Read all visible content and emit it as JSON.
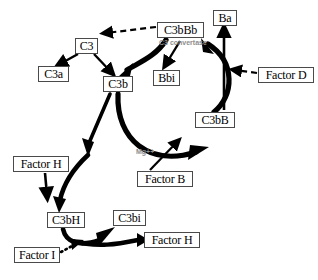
{
  "diagram": {
    "nodes": [
      {
        "id": "c3",
        "label": "C3",
        "x": 75,
        "y": 38,
        "w": 23,
        "h": 16
      },
      {
        "id": "c3a",
        "label": "C3a",
        "x": 38,
        "y": 66,
        "w": 31,
        "h": 16
      },
      {
        "id": "c3b",
        "label": "C3b",
        "x": 103,
        "y": 76,
        "w": 30,
        "h": 16
      },
      {
        "id": "bbi",
        "label": "Bbi",
        "x": 153,
        "y": 70,
        "w": 27,
        "h": 16
      },
      {
        "id": "c3bbb",
        "label": "C3bBb",
        "x": 157,
        "y": 22,
        "w": 47,
        "h": 16
      },
      {
        "id": "ba",
        "label": "Ba",
        "x": 213,
        "y": 10,
        "w": 24,
        "h": 16
      },
      {
        "id": "factord",
        "label": "Factor D",
        "x": 258,
        "y": 67,
        "w": 56,
        "h": 16
      },
      {
        "id": "c3bb",
        "label": "C3bB",
        "x": 195,
        "y": 112,
        "w": 40,
        "h": 16
      },
      {
        "id": "factorb",
        "label": "Factor B",
        "x": 137,
        "y": 171,
        "w": 56,
        "h": 16
      },
      {
        "id": "factorh1",
        "label": "Factor H",
        "x": 13,
        "y": 156,
        "w": 56,
        "h": 16
      },
      {
        "id": "c3bh",
        "label": "C3bH",
        "x": 47,
        "y": 212,
        "w": 38,
        "h": 16
      },
      {
        "id": "c3bi",
        "label": "C3bi",
        "x": 113,
        "y": 210,
        "w": 33,
        "h": 16
      },
      {
        "id": "factorh2",
        "label": "Factor H",
        "x": 144,
        "y": 232,
        "w": 56,
        "h": 16
      },
      {
        "id": "factori",
        "label": "Factor I",
        "x": 14,
        "y": 247,
        "w": 46,
        "h": 16
      }
    ],
    "annotations": [
      {
        "id": "c3-convertase",
        "label": "C3 convertase",
        "x": 159,
        "y": 39,
        "color": "#8d8d8d"
      },
      {
        "id": "mg-cofactor",
        "label": "Mg++",
        "x": 136,
        "y": 148,
        "color": "#8d8d8d"
      }
    ],
    "edges": [
      {
        "id": "c3-to-c3a",
        "from": "C3",
        "to": "C3a",
        "style": "solid-thin"
      },
      {
        "id": "c3-to-c3b",
        "from": "C3",
        "to": "C3b",
        "style": "solid-thin"
      },
      {
        "id": "c3bbb-to-c3",
        "from": "C3bBb",
        "to": "C3",
        "style": "dashed"
      },
      {
        "id": "c3bbb-to-c3b",
        "from": "C3bBb",
        "to": "C3b",
        "style": "solid-thick"
      },
      {
        "id": "c3bbb-to-bbi",
        "from": "C3bBb",
        "to": "Bbi",
        "style": "solid-thin"
      },
      {
        "id": "c3bb-to-c3bbb",
        "from": "C3bB",
        "to": "C3bBb",
        "style": "solid-thick"
      },
      {
        "id": "c3bb-to-ba",
        "from": "C3bB",
        "to": "Ba",
        "style": "solid-thin"
      },
      {
        "id": "factord-to-c3bb",
        "from": "Factor D",
        "to": "C3bB",
        "style": "dashed"
      },
      {
        "id": "c3b-to-c3bb",
        "from": "C3b",
        "to": "C3bB",
        "style": "solid-thick"
      },
      {
        "id": "factorb-to-c3bb",
        "from": "Factor B",
        "to": "C3bB",
        "style": "solid-thin"
      },
      {
        "id": "c3b-to-c3bh",
        "from": "C3b",
        "to": "C3bH",
        "style": "solid-thick"
      },
      {
        "id": "factorh-to-c3bh",
        "from": "Factor H",
        "to": "C3bH",
        "style": "solid-thin"
      },
      {
        "id": "c3bh-to-c3bi",
        "from": "C3bH",
        "to": "C3bi",
        "style": "solid-thick"
      },
      {
        "id": "c3bh-to-factorh",
        "from": "C3bH",
        "to": "Factor H",
        "style": "solid-thick"
      },
      {
        "id": "factori-to-c3bh",
        "from": "Factor I",
        "to": "C3bH",
        "style": "dotted"
      }
    ],
    "colors": {
      "stroke": "#000000",
      "box_border": "#4a4a4a",
      "annotation": "#8d8d8d",
      "background": "#ffffff"
    }
  }
}
